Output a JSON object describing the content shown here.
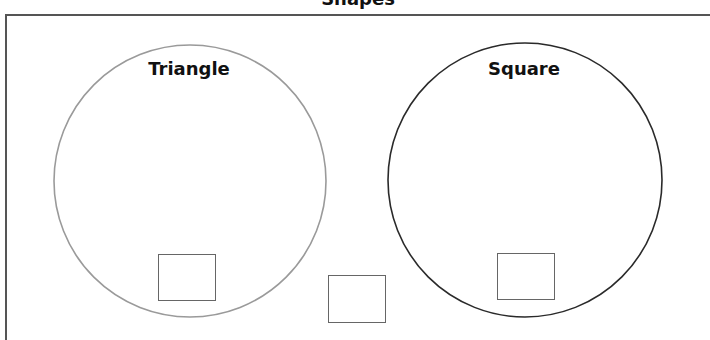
{
  "title": "Shapes",
  "circles": [
    {
      "label": "Triangle",
      "stroke": "#9a9a9a",
      "cx": 190,
      "cy": 181,
      "r": 136
    },
    {
      "label": "Square",
      "stroke": "#2a2a2a",
      "cx": 525,
      "cy": 180,
      "r": 137
    }
  ],
  "boxes": [
    {
      "name": "triangle-answer-box",
      "value": ""
    },
    {
      "name": "overlap-answer-box",
      "value": ""
    },
    {
      "name": "square-answer-box",
      "value": ""
    }
  ]
}
